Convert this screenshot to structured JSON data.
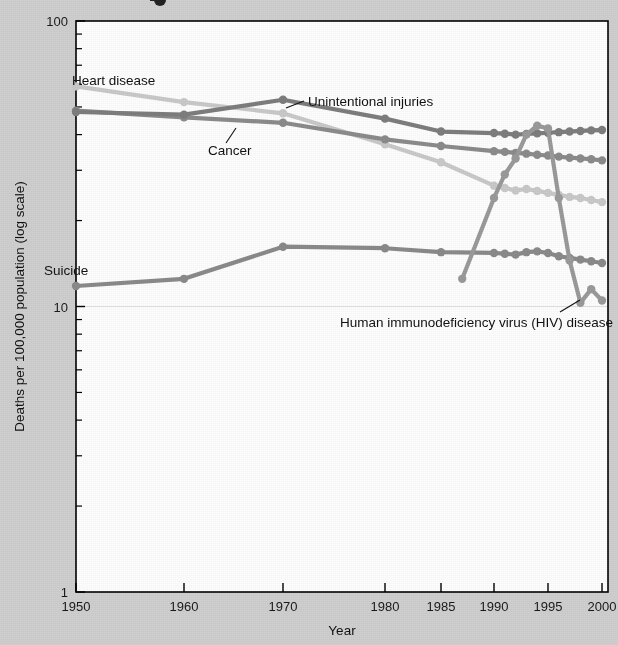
{
  "figure": {
    "partial_title_glyph": "",
    "background_color": "#cfcfcf",
    "plot_background_color": "#fdfdfd"
  },
  "axes": {
    "x": {
      "title": "Year",
      "tick_labels": [
        "1950",
        "1960",
        "1970",
        "1980",
        "1985",
        "1990",
        "1995",
        "2000"
      ],
      "tick_values": [
        1950,
        1960,
        1970,
        1980,
        1985,
        1990,
        1995,
        2000
      ]
    },
    "y": {
      "title": "Deaths per 100,000 population (log scale)",
      "tick_labels": [
        "100",
        "10",
        "1"
      ],
      "tick_values": [
        100,
        10,
        1
      ],
      "scale": "log",
      "range": [
        1,
        100
      ],
      "minor_ticks": [
        90,
        80,
        70,
        60,
        50,
        40,
        30,
        20,
        9,
        8,
        7,
        6,
        5,
        4,
        3,
        2
      ]
    }
  },
  "annotations": [
    {
      "name": "heart-disease",
      "text": "Heart disease",
      "x": 72,
      "y": 85,
      "anchor": "start",
      "leader": null
    },
    {
      "name": "cancer",
      "text": "Cancer",
      "x": 208,
      "y": 155,
      "anchor": "start",
      "leader": [
        [
          226,
          143
        ],
        [
          236,
          128
        ]
      ]
    },
    {
      "name": "unintentional-injuries",
      "text": "Unintentional injuries",
      "x": 308,
      "y": 106,
      "anchor": "start",
      "leader": [
        [
          304,
          101
        ],
        [
          286,
          108
        ]
      ]
    },
    {
      "name": "suicide",
      "text": "Suicide",
      "x": 44,
      "y": 275,
      "anchor": "start",
      "leader": null
    },
    {
      "name": "hiv-disease",
      "text": "Human immunodeficiency virus (HIV) disease",
      "x": 340,
      "y": 327,
      "anchor": "start",
      "leader": [
        [
          560,
          312
        ],
        [
          580,
          300
        ]
      ]
    }
  ],
  "colors": {
    "heart_disease": "#c9c9c9",
    "cancer": "#8b8b8b",
    "unintentional_injuries": "#7d7d7d",
    "suicide": "#8a8a8a",
    "hiv_disease": "#9a9a9a",
    "axis": "#000000",
    "text": "#111111"
  },
  "chart_data": {
    "type": "line",
    "title": "",
    "xlabel": "Year",
    "ylabel": "Deaths per 100,000 population (log scale)",
    "yscale": "log",
    "ylim": [
      1,
      100
    ],
    "grid": false,
    "legend": "inline-annotations",
    "series": [
      {
        "name": "Heart disease",
        "color": "#c9c9c9",
        "x": [
          1950,
          1960,
          1970,
          1980,
          1985,
          1990,
          1991,
          1992,
          1993,
          1994,
          1995,
          1996,
          1997,
          1998,
          1999,
          2000
        ],
        "y": [
          59.0,
          52.0,
          47.5,
          37.0,
          32.0,
          26.5,
          26.0,
          25.5,
          25.8,
          25.4,
          25.0,
          24.6,
          24.2,
          24.0,
          23.6,
          23.2
        ]
      },
      {
        "name": "Cancer",
        "color": "#8b8b8b",
        "x": [
          1950,
          1960,
          1970,
          1980,
          1985,
          1990,
          1991,
          1992,
          1993,
          1994,
          1995,
          1996,
          1997,
          1998,
          1999,
          2000
        ],
        "y": [
          48.5,
          46.0,
          44.0,
          38.5,
          36.5,
          35.0,
          34.8,
          34.5,
          34.3,
          34.0,
          33.8,
          33.5,
          33.2,
          33.0,
          32.8,
          32.5
        ]
      },
      {
        "name": "Unintentional injuries",
        "color": "#7d7d7d",
        "x": [
          1950,
          1960,
          1970,
          1980,
          1985,
          1990,
          1991,
          1992,
          1993,
          1994,
          1995,
          1996,
          1997,
          1998,
          1999,
          2000
        ],
        "y": [
          48.0,
          47.0,
          53.0,
          45.5,
          41.0,
          40.5,
          40.3,
          40.0,
          40.2,
          40.4,
          40.6,
          40.8,
          41.0,
          41.2,
          41.4,
          41.5
        ]
      },
      {
        "name": "Suicide",
        "color": "#8a8a8a",
        "x": [
          1950,
          1960,
          1970,
          1980,
          1985,
          1990,
          1991,
          1992,
          1993,
          1994,
          1995,
          1996,
          1997,
          1998,
          1999,
          2000
        ],
        "y": [
          11.8,
          12.5,
          16.2,
          16.0,
          15.5,
          15.4,
          15.3,
          15.2,
          15.5,
          15.6,
          15.4,
          15.0,
          14.8,
          14.6,
          14.4,
          14.2
        ]
      },
      {
        "name": "Human immunodeficiency virus (HIV) disease",
        "color": "#9a9a9a",
        "x": [
          1987,
          1990,
          1991,
          1992,
          1993,
          1994,
          1995,
          1996,
          1997,
          1998,
          1999,
          2000
        ],
        "y": [
          12.5,
          24.0,
          29.0,
          33.0,
          40.0,
          43.0,
          42.0,
          24.0,
          14.5,
          10.3,
          11.5,
          10.5
        ]
      }
    ]
  }
}
